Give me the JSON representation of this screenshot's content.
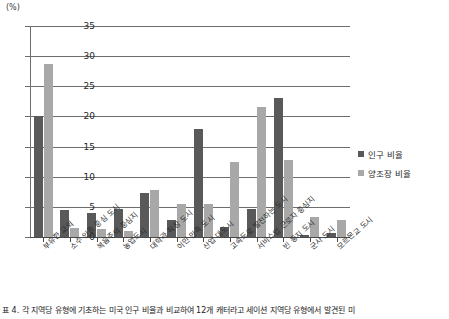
{
  "chart_data": {
    "type": "bar",
    "title": "",
    "xlabel": "",
    "ylabel": "(%)",
    "ylim": [
      0,
      35
    ],
    "ytick_step": 5,
    "yticks": [
      "0",
      "5",
      "10",
      "15",
      "20",
      "25",
      "30",
      "35"
    ],
    "grid": true,
    "legend_position": "right",
    "categories": [
      "부유한 교외",
      "소수 인종 중심 도시",
      "복음주의 중심지",
      "농업도시",
      "대학과 직장 도시",
      "이민 민족 도시",
      "산업 대도시",
      "고속도로 발전하는 도시",
      "서비스업 근로자 중심지",
      "빈 둥지 도시",
      "군사 도시",
      "모르몬교 도시"
    ],
    "series": [
      {
        "name": "인구 비율",
        "color": "#595959",
        "values": [
          20.0,
          4.4,
          4.0,
          4.6,
          7.3,
          2.8,
          18.0,
          1.6,
          4.6,
          23.0,
          0.4,
          0.7
        ]
      },
      {
        "name": "양조장 비율",
        "color": "#a8a8a8",
        "values": [
          28.7,
          1.5,
          1.4,
          1.0,
          7.8,
          5.5,
          5.5,
          12.5,
          21.6,
          12.8,
          3.4,
          2.9
        ]
      }
    ]
  },
  "legend": {
    "items": [
      {
        "label": "인구 비율",
        "swatch": "pop"
      },
      {
        "label": "양조장 비율",
        "swatch": "brew"
      }
    ]
  },
  "axis": {
    "unit_label": "(%)"
  },
  "caption": {
    "text": "표 4. 각 지역당 유형에 기초하는 미국 인구 비율과 비교하여 12개 캐터라고 세이션 지역당 유형에서 발견된 미"
  }
}
